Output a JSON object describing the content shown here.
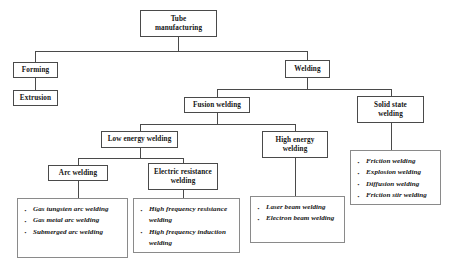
{
  "diagram": {
    "nodes": {
      "root": "Tube\nmanufacturing",
      "forming": "Forming",
      "extrusion": "Extrusion",
      "welding": "Welding",
      "fusion_welding": "Fusion welding",
      "solid_state_welding": "Solid state\nwelding",
      "low_energy_welding": "Low energy welding",
      "high_energy_welding": "High energy\nwelding",
      "arc_welding": "Arc welding",
      "electric_resistance_welding": "Electric resistance\nwelding"
    },
    "lists": {
      "arc_welding_items": [
        "Gas tungsten arc welding",
        "Gas metal arc welding",
        "Submerged arc welding"
      ],
      "electric_resistance_items": [
        "High frequency resistance welding",
        "High frequency induction welding"
      ],
      "high_energy_items": [
        "Laser beam welding",
        "Electron beam welding"
      ],
      "solid_state_items": [
        "Friction welding",
        "Explosion welding",
        "Diffusion welding",
        "Friction stir welding"
      ]
    },
    "colors": {
      "box_border": "#4a4a4a",
      "list_border": "#8a8a8a",
      "text": "#141414",
      "background": "#ffffff",
      "line": "#4a4a4a"
    }
  }
}
